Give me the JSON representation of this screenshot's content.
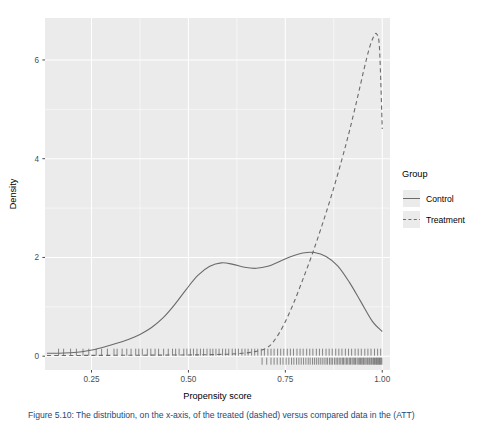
{
  "chart_data": {
    "type": "line",
    "title": "",
    "subtitle": "",
    "xlabel": "Propensity score",
    "ylabel": "Density",
    "xlim": [
      0.13,
      1.02
    ],
    "ylim": [
      -0.28,
      6.85
    ],
    "xticks": [
      0.25,
      0.5,
      0.75,
      1.0
    ],
    "xticklabels": [
      "0.25",
      "0.50",
      "0.75",
      "1.00"
    ],
    "yticks": [
      0,
      2,
      4,
      6
    ],
    "yticklabels": [
      "0",
      "2",
      "4",
      "6"
    ],
    "grid": "major-and-minor-white-on-grey",
    "legend": {
      "title": "Group",
      "position": "right",
      "entries": [
        {
          "label": "Control",
          "linestyle": "solid",
          "color": "#6b6b6b"
        },
        {
          "label": "Treatment",
          "linestyle": "dashed",
          "color": "#6b6b6b"
        }
      ]
    },
    "series": [
      {
        "name": "Control",
        "linestyle": "solid",
        "color": "#6b6b6b",
        "x": [
          0.135,
          0.165,
          0.195,
          0.225,
          0.255,
          0.285,
          0.315,
          0.345,
          0.375,
          0.405,
          0.435,
          0.465,
          0.495,
          0.525,
          0.555,
          0.585,
          0.615,
          0.645,
          0.675,
          0.705,
          0.735,
          0.765,
          0.795,
          0.825,
          0.855,
          0.885,
          0.915,
          0.945,
          0.975,
          1.0
        ],
        "y": [
          0.06,
          0.06,
          0.07,
          0.09,
          0.13,
          0.19,
          0.26,
          0.34,
          0.44,
          0.58,
          0.78,
          1.05,
          1.36,
          1.64,
          1.82,
          1.89,
          1.86,
          1.8,
          1.78,
          1.82,
          1.92,
          2.02,
          2.09,
          2.1,
          2.02,
          1.83,
          1.5,
          1.1,
          0.7,
          0.5
        ]
      },
      {
        "name": "Treatment",
        "linestyle": "dashed",
        "color": "#6b6b6b",
        "x": [
          0.135,
          0.2,
          0.26,
          0.32,
          0.38,
          0.44,
          0.5,
          0.55,
          0.6,
          0.64,
          0.67,
          0.7,
          0.72,
          0.745,
          0.77,
          0.795,
          0.82,
          0.845,
          0.87,
          0.895,
          0.915,
          0.935,
          0.952,
          0.966,
          0.978,
          0.986,
          0.993,
          1.0
        ],
        "y": [
          0.015,
          0.015,
          0.016,
          0.018,
          0.02,
          0.022,
          0.025,
          0.03,
          0.04,
          0.06,
          0.09,
          0.16,
          0.3,
          0.62,
          1.05,
          1.55,
          2.08,
          2.66,
          3.28,
          3.96,
          4.55,
          5.2,
          5.78,
          6.22,
          6.48,
          6.52,
          6.22,
          4.6
        ]
      }
    ],
    "rugs": [
      {
        "name": "Control",
        "values": [
          0.165,
          0.178,
          0.196,
          0.211,
          0.228,
          0.243,
          0.262,
          0.276,
          0.291,
          0.308,
          0.316,
          0.329,
          0.341,
          0.352,
          0.364,
          0.372,
          0.381,
          0.394,
          0.403,
          0.414,
          0.423,
          0.436,
          0.448,
          0.459,
          0.467,
          0.476,
          0.488,
          0.496,
          0.505,
          0.513,
          0.522,
          0.531,
          0.539,
          0.548,
          0.556,
          0.563,
          0.571,
          0.579,
          0.588,
          0.596,
          0.604,
          0.613,
          0.621,
          0.629,
          0.638,
          0.646,
          0.654,
          0.663,
          0.671,
          0.679,
          0.688,
          0.696,
          0.705,
          0.713,
          0.721,
          0.73,
          0.738,
          0.746,
          0.755,
          0.763,
          0.771,
          0.78,
          0.788,
          0.796,
          0.805,
          0.813,
          0.821,
          0.83,
          0.838,
          0.846,
          0.855,
          0.863,
          0.871,
          0.88,
          0.888,
          0.896,
          0.905,
          0.913,
          0.921,
          0.93,
          0.938,
          0.946,
          0.955,
          0.963,
          0.971,
          0.98,
          0.988,
          0.996
        ]
      },
      {
        "name": "Treatment",
        "values": [
          0.69,
          0.702,
          0.713,
          0.721,
          0.729,
          0.737,
          0.744,
          0.752,
          0.759,
          0.766,
          0.772,
          0.779,
          0.785,
          0.791,
          0.797,
          0.803,
          0.809,
          0.814,
          0.82,
          0.825,
          0.83,
          0.835,
          0.84,
          0.845,
          0.85,
          0.855,
          0.859,
          0.864,
          0.868,
          0.872,
          0.877,
          0.881,
          0.885,
          0.889,
          0.893,
          0.897,
          0.9,
          0.904,
          0.908,
          0.911,
          0.915,
          0.918,
          0.922,
          0.925,
          0.928,
          0.931,
          0.935,
          0.938,
          0.941,
          0.944,
          0.947,
          0.95,
          0.952,
          0.955,
          0.958,
          0.961,
          0.963,
          0.966,
          0.968,
          0.971,
          0.973,
          0.976,
          0.978,
          0.98,
          0.983,
          0.985,
          0.987,
          0.989,
          0.991,
          0.993,
          0.995,
          0.997,
          0.999
        ]
      }
    ],
    "colors": {
      "panel_background": "#ebebeb",
      "gridline": "#ffffff",
      "curve": "#6b6b6b",
      "axis_text": "#4d4d4d",
      "caption_text": "#1b4a7a"
    }
  },
  "caption": {
    "text": "Figure 5.10:  The distribution, on the x-axis, of the treated (dashed) versus compared data in the (ATT)"
  }
}
